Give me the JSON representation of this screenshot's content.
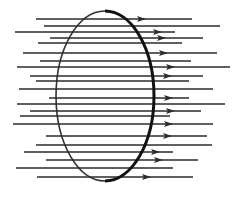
{
  "diagram": {
    "type": "magnetic-flux-through-loop",
    "colors": {
      "line": "#2b2b2b",
      "loop": "#111111",
      "background": "#ffffff"
    },
    "loop": {
      "shape": "ellipse",
      "cx": 105,
      "cy": 96,
      "rx": 49,
      "ry": 85,
      "front_side": "right",
      "back_side": "left"
    },
    "field_lines": [
      {
        "y": 19,
        "x1": 36,
        "x2": 192,
        "arrow_x": 141
      },
      {
        "y": 26,
        "x1": 44,
        "x2": 220,
        "arrow_x": null
      },
      {
        "y": 32,
        "x1": 15,
        "x2": 175,
        "arrow_x": 157
      },
      {
        "y": 38,
        "x1": 50,
        "x2": 203,
        "arrow_x": 161
      },
      {
        "y": 43,
        "x1": 38,
        "x2": 182,
        "arrow_x": null
      },
      {
        "y": 53,
        "x1": 23,
        "x2": 217,
        "arrow_x": 163
      },
      {
        "y": 61,
        "x1": 40,
        "x2": 191,
        "arrow_x": null
      },
      {
        "y": 67,
        "x1": 17,
        "x2": 230,
        "arrow_x": 170
      },
      {
        "y": 76,
        "x1": 30,
        "x2": 203,
        "arrow_x": 167
      },
      {
        "y": 81,
        "x1": 36,
        "x2": 189,
        "arrow_x": null
      },
      {
        "y": 89,
        "x1": 19,
        "x2": 213,
        "arrow_x": null
      },
      {
        "y": 98,
        "x1": 49,
        "x2": 189,
        "arrow_x": 168
      },
      {
        "y": 104,
        "x1": 17,
        "x2": 225,
        "arrow_x": null
      },
      {
        "y": 111,
        "x1": 30,
        "x2": 201,
        "arrow_x": 170
      },
      {
        "y": 116,
        "x1": 20,
        "x2": 170,
        "arrow_x": null
      },
      {
        "y": 124,
        "x1": 13,
        "x2": 213,
        "arrow_x": 168
      },
      {
        "y": 136,
        "x1": 46,
        "x2": 207,
        "arrow_x": 167
      },
      {
        "y": 145,
        "x1": 36,
        "x2": 212,
        "arrow_x": null
      },
      {
        "y": 152,
        "x1": 24,
        "x2": 173,
        "arrow_x": 155
      },
      {
        "y": 160,
        "x1": 46,
        "x2": 198,
        "arrow_x": 158
      },
      {
        "y": 168,
        "x1": 16,
        "x2": 173,
        "arrow_x": null
      },
      {
        "y": 177,
        "x1": 37,
        "x2": 193,
        "arrow_x": 146
      }
    ]
  }
}
